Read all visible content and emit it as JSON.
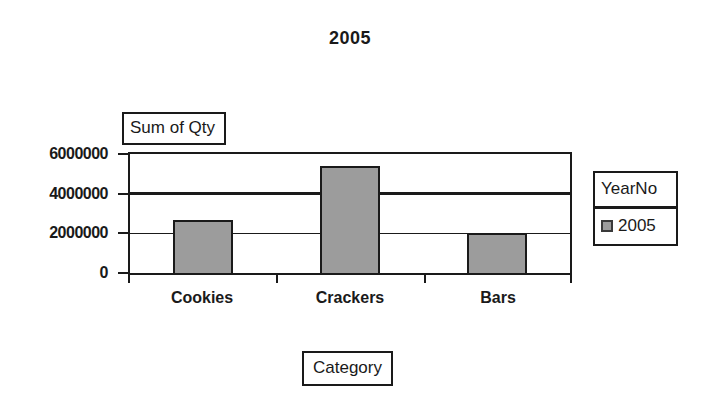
{
  "chart": {
    "title": "2005",
    "value_axis_title": "Sum of Qty",
    "category_axis_title": "Category",
    "legend": {
      "title": "YearNo",
      "items": [
        {
          "label": "2005",
          "swatch_color": "#9c9c9c"
        }
      ]
    }
  },
  "chart_data": {
    "type": "bar",
    "title": "2005",
    "categories": [
      "Cookies",
      "Crackers",
      "Bars"
    ],
    "series": [
      {
        "name": "2005",
        "values": [
          2650000,
          5400000,
          2000000
        ]
      }
    ],
    "ylabel": "Sum of Qty",
    "xlabel": "Category",
    "y_ticks": [
      0,
      2000000,
      4000000,
      6000000
    ],
    "y_tick_labels": [
      "0",
      "2000000",
      "4000000",
      "6000000"
    ],
    "ylim": [
      0,
      6000000
    ],
    "grid": true,
    "emphasized_gridline": 4000000,
    "legend_title": "YearNo",
    "legend_position": "right",
    "bar_color": "#9c9c9c",
    "axis_color": "#1a1a1a",
    "background_color": "#ffffff"
  }
}
